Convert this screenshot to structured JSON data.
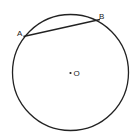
{
  "diagram": {
    "type": "circle-with-chord",
    "circle": {
      "cx": 70.5,
      "cy": 72.5,
      "r": 58,
      "stroke": "#222222"
    },
    "chord": {
      "from": "A",
      "to": "B"
    },
    "points": [
      {
        "id": "A",
        "label": "A",
        "x": 23.5,
        "y": 36.5,
        "label_x": 17,
        "label_y": 36
      },
      {
        "id": "B",
        "label": "B",
        "x": 100,
        "y": 19.5,
        "label_x": 99,
        "label_y": 19
      }
    ],
    "center": {
      "label": "O",
      "x": 70.5,
      "y": 73,
      "label_x": 73.5,
      "label_y": 76
    }
  }
}
